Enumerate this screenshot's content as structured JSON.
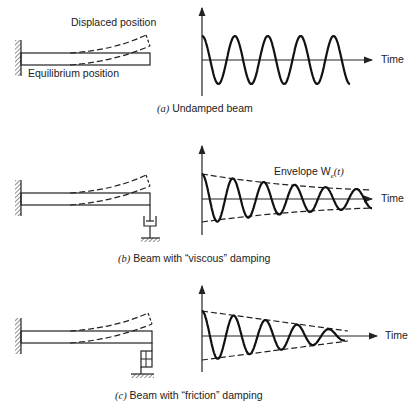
{
  "panels": [
    {
      "id": "a",
      "label": "(a)",
      "caption": "Undamped beam",
      "beam_labels": {
        "displaced": "Displaced position",
        "equilibrium": "Equilibrium position"
      },
      "time_label": "Time",
      "support": "none"
    },
    {
      "id": "b",
      "label": "(b)",
      "caption": "Beam with “viscous” damping",
      "time_label": "Time",
      "envelope_label": "Envelope W",
      "envelope_sub": "e",
      "envelope_arg": "(t)",
      "support": "viscous-dashpot"
    },
    {
      "id": "c",
      "label": "(c)",
      "caption": "Beam with “friction” damping",
      "time_label": "Time",
      "support": "friction-block"
    }
  ],
  "chart_data": [
    {
      "type": "line",
      "title": "(a) Undamped beam",
      "xlabel": "Time",
      "ylabel": "",
      "series": [
        {
          "name": "displacement",
          "form": "constant-amplitude sinusoid",
          "amplitude": 1.0,
          "cycles": 4.5
        }
      ],
      "grid": false
    },
    {
      "type": "line",
      "title": "(b) Beam with \"viscous\" damping",
      "xlabel": "Time",
      "ylabel": "",
      "series": [
        {
          "name": "displacement",
          "form": "exponentially decaying sinusoid",
          "initial_amplitude": 1.0,
          "cycles": 5.5
        },
        {
          "name": "Envelope W_e(t)",
          "form": "exponential decay (dashed)",
          "style": "dashed"
        }
      ],
      "annotations": [
        "Envelope W_e(t)"
      ],
      "grid": false
    },
    {
      "type": "line",
      "title": "(c) Beam with \"friction\" damping",
      "xlabel": "Time",
      "ylabel": "",
      "series": [
        {
          "name": "displacement",
          "form": "linearly decaying sinusoid",
          "initial_amplitude": 1.0,
          "cycles": 4.5
        },
        {
          "name": "envelope",
          "form": "linear decay (dashed)",
          "style": "dashed"
        }
      ],
      "grid": false
    }
  ]
}
